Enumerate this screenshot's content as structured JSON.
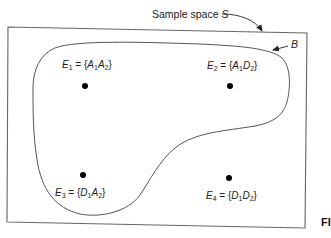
{
  "diagram": {
    "sample_space_label": "Sample space",
    "sample_space_symbol": "S",
    "set_label": "B",
    "figure_label_fragment": "FI",
    "events": [
      {
        "name": "E",
        "index": "1",
        "equals": " = {",
        "outcome1_letter": "A",
        "outcome1_index": "1",
        "outcome2_letter": "A",
        "outcome2_index": "2",
        "close": "}",
        "inside_B": true
      },
      {
        "name": "E",
        "index": "2",
        "equals": " = {",
        "outcome1_letter": "A",
        "outcome1_index": "1",
        "outcome2_letter": "D",
        "outcome2_index": "2",
        "close": "}",
        "inside_B": true
      },
      {
        "name": "E",
        "index": "3",
        "equals": " = {",
        "outcome1_letter": "D",
        "outcome1_index": "1",
        "outcome2_letter": "A",
        "outcome2_index": "2",
        "close": "}",
        "inside_B": true
      },
      {
        "name": "E",
        "index": "4",
        "equals": " = {",
        "outcome1_letter": "D",
        "outcome1_index": "1",
        "outcome2_letter": "D",
        "outcome2_index": "2",
        "close": "}",
        "inside_B": false
      }
    ],
    "colors": {
      "line": "#555555",
      "dot": "#000000",
      "text": "#222222",
      "background": "#ffffff"
    }
  }
}
